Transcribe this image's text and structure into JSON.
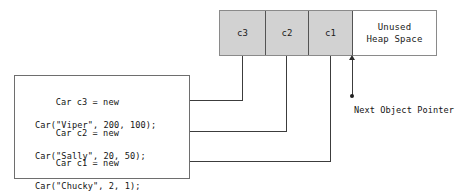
{
  "diagram": {
    "heap": {
      "cells": [
        {
          "label": "c3",
          "state": "used"
        },
        {
          "label": "c2",
          "state": "used"
        },
        {
          "label": "c1",
          "state": "used"
        }
      ],
      "unused": {
        "line1": "Unused",
        "line2": "Heap Space"
      }
    },
    "pointer": {
      "label": "Next Object Pointer"
    },
    "code": {
      "statements": [
        {
          "id": "c3",
          "line1": "Car c3 = new",
          "line2": "Car(\"Viper\", 200, 100);"
        },
        {
          "id": "c2",
          "line1": "Car c2 = new",
          "line2": "Car(\"Sally\", 20, 50);"
        },
        {
          "id": "c1",
          "line1": "Car c1 = new",
          "line2": "Car(\"Chucky\", 2, 1);"
        }
      ]
    },
    "colors": {
      "used_fill": "#d2d2d2",
      "free_fill": "#ffffff",
      "outline": "#8a8a8a",
      "divider": "#545454",
      "connector": "#3c3c3c",
      "text": "#141414"
    }
  }
}
